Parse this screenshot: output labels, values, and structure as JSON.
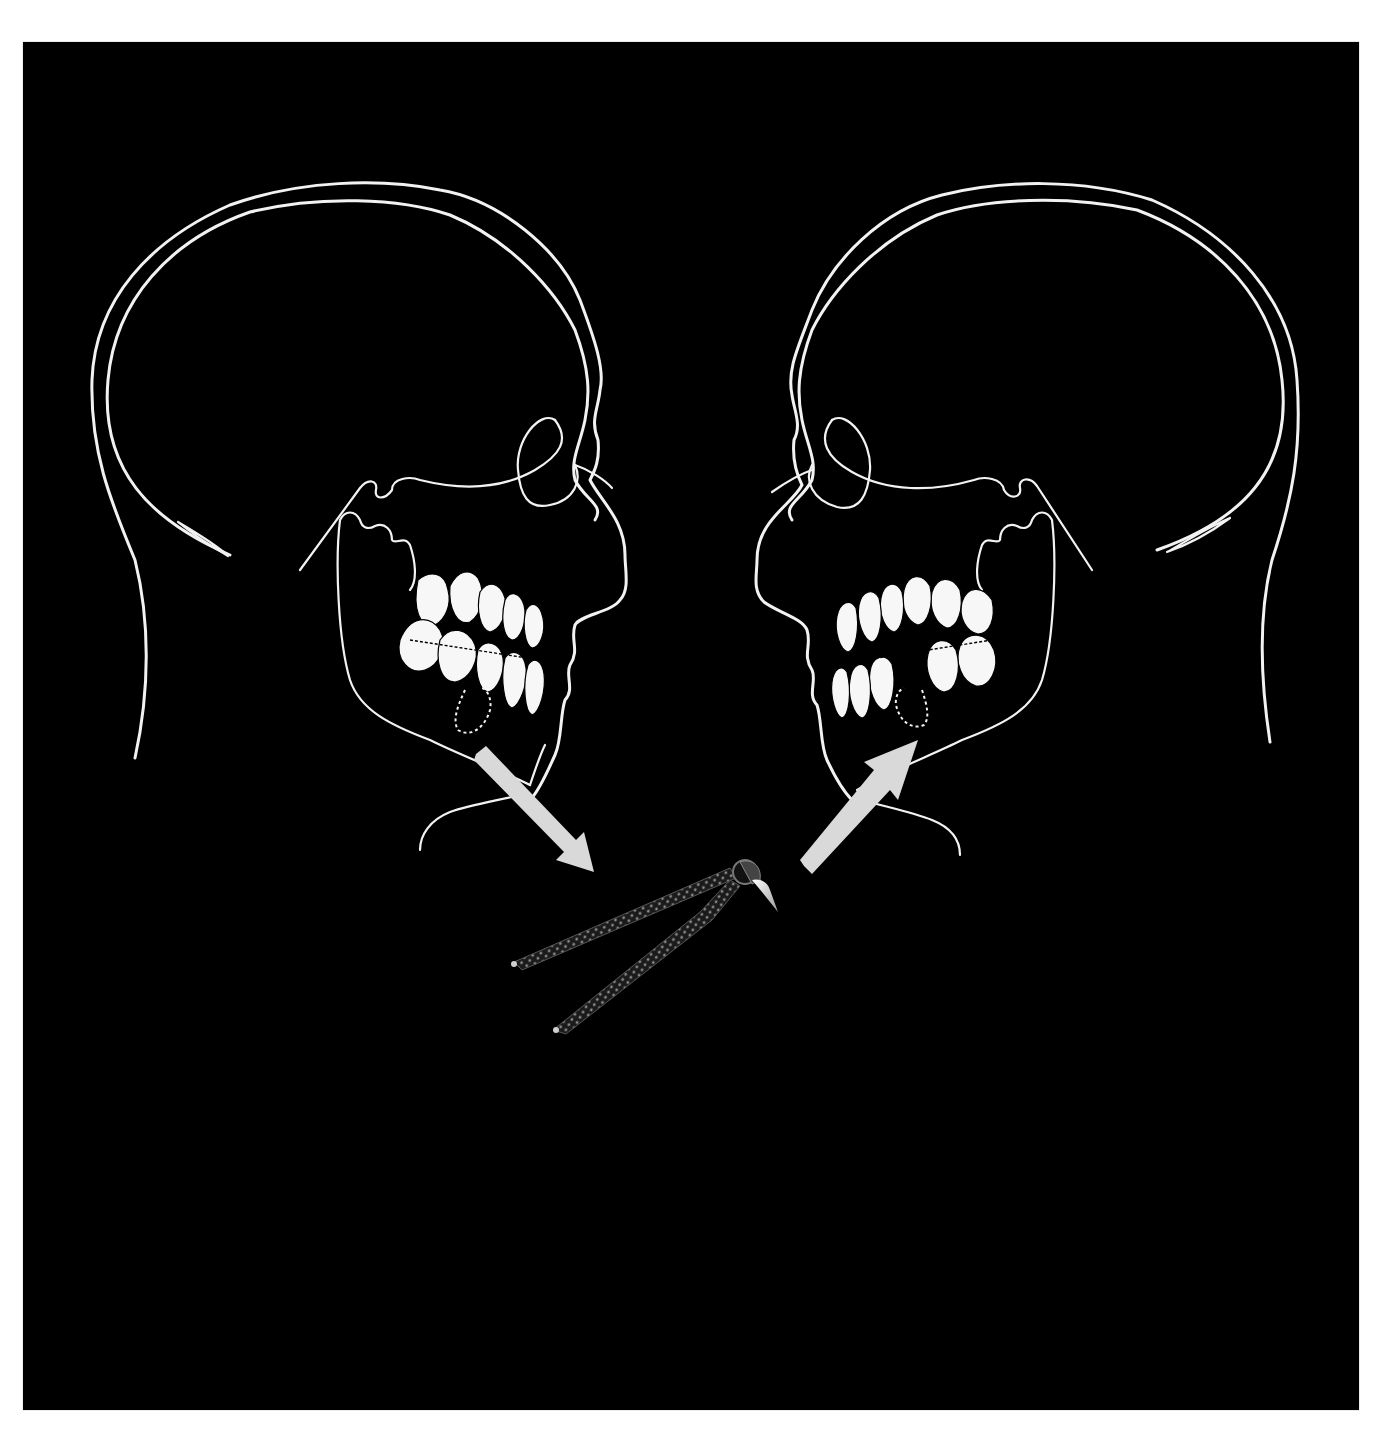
{
  "figure": {
    "background_color": "#000000",
    "frame_color": "#ffffff",
    "line_color": "#f2f2f2",
    "arrow_color": "#d9d9d9"
  },
  "left_head": {
    "facing": "right",
    "extraction_site": "lower premolar (dotted outline)"
  },
  "right_head": {
    "facing": "left",
    "extraction_site": "lower premolar (dotted outline)"
  },
  "arrows": [
    {
      "from": "left mandible",
      "to": "forceps",
      "direction": "down-right"
    },
    {
      "from": "forceps",
      "to": "right mandible",
      "direction": "up-right"
    }
  ],
  "instrument": {
    "name": "dental extraction forceps",
    "holding": "extracted tooth"
  }
}
